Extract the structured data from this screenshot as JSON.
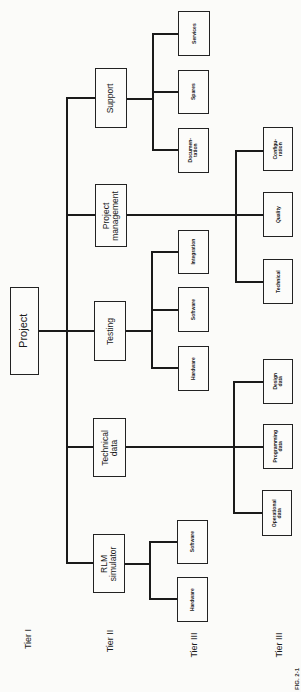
{
  "diagram": {
    "type": "hierarchy / work breakdown structure",
    "orientation": "rotated 90° counter-clockwise",
    "root": {
      "label": "Project",
      "tier": "Tier I"
    },
    "tier2": [
      {
        "label": "Support",
        "children": [
          "Documen-\ntation",
          "Spares",
          "Services"
        ]
      },
      {
        "label": "Project\nmanagement",
        "children": [
          "Technical",
          "Quality",
          "Configu-\nration"
        ]
      },
      {
        "label": "Testing",
        "children": [
          "Hardware",
          "Software",
          "Integration"
        ]
      },
      {
        "label": "Technical\ndata",
        "children": [
          "Operational\ndata",
          "Programming\ndata",
          "Design\ndata"
        ]
      },
      {
        "label": "RLM\nsimulator",
        "children": [
          "Hardware",
          "Software"
        ]
      }
    ],
    "tier_labels": [
      "Tier I",
      "Tier II",
      "Tier III",
      "Tier III"
    ],
    "caption": "FIG. 2-1"
  },
  "boxes": {
    "project": "Project",
    "support": "Support",
    "project_management": "Project\nmanagement",
    "testing": "Testing",
    "technical_data": "Technical\ndata",
    "rlm_simulator": "RLM\nsimulator",
    "services": "Services",
    "spares": "Spares",
    "documentation": "Documen-\ntation",
    "integration": "Integration",
    "testing_software": "Software",
    "testing_hardware": "Hardware",
    "rlm_software": "Software",
    "rlm_hardware": "Hardware",
    "configuration": "Configu-\nration",
    "quality": "Quality",
    "technical": "Technical",
    "design_data": "Design\ndata",
    "programming_data": "Programming\ndata",
    "operational_data": "Operational\ndata"
  },
  "tiers": {
    "tier1": "Tier I",
    "tier2": "Tier II",
    "tier3a": "Tier III",
    "tier3b": "Tier III"
  },
  "caption": "FIG. 2-1"
}
